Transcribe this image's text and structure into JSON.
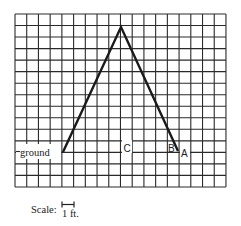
{
  "diagram": {
    "type": "grid-diagram",
    "grid": {
      "left": 15,
      "top": 14,
      "cols": 18,
      "rows": 15,
      "cell_w": 11.72,
      "cell_h": 11.53,
      "line_color": "#2a2a2a"
    },
    "shape": {
      "description": "Inverted V (ladder/A-frame) on grid",
      "apex": [
        121,
        27
      ],
      "left_foot": [
        63,
        152
      ],
      "right_foot": [
        178,
        151
      ],
      "stroke_color": "#1a1a1a"
    },
    "labels": {
      "ground": "ground",
      "point_c": "C",
      "point_b": "B",
      "point_a": "A"
    },
    "scale": {
      "label": "Scale:",
      "unit_text": "1 ft."
    }
  }
}
